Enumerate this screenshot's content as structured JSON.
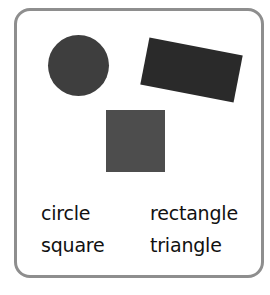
{
  "card": {
    "border_color": "#8e8e8e"
  },
  "shapes": [
    {
      "name": "circle",
      "color": "#3e3e3e"
    },
    {
      "name": "rectangle",
      "color": "#2a2a2a"
    },
    {
      "name": "square",
      "color": "#4d4d4d"
    }
  ],
  "labels": [
    "circle",
    "rectangle",
    "square",
    "triangle"
  ]
}
